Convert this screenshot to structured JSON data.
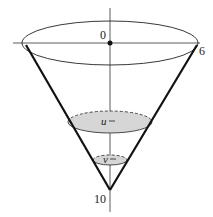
{
  "diagram": {
    "labels": {
      "origin": "0",
      "radius": "6",
      "depth": "10",
      "u_label": "u",
      "v_label": "v"
    },
    "colors": {
      "stroke": "#1a1a1a",
      "fill": "#d6d6d6"
    }
  }
}
